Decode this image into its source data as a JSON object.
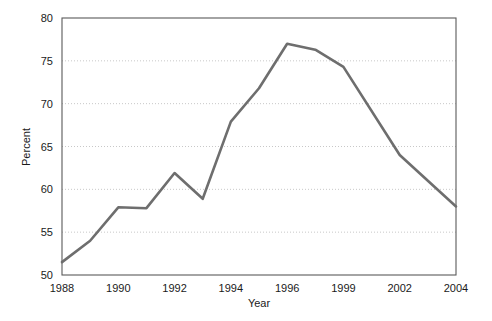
{
  "chart_data": {
    "type": "line",
    "title": "",
    "xlabel": "Year",
    "ylabel": "Percent",
    "grid": true,
    "legend": "none",
    "xtick_labels": [
      "1988",
      "1990",
      "1992",
      "1994",
      "1996",
      "1999",
      "2002",
      "2004"
    ],
    "ytick_labels": [
      "50",
      "55",
      "60",
      "65",
      "70",
      "75",
      "80"
    ],
    "ylim": [
      50,
      80
    ],
    "yticks": [
      50,
      55,
      60,
      65,
      70,
      75,
      80
    ],
    "x": [
      "1988",
      "1989",
      "1990",
      "1991",
      "1992",
      "1993",
      "1994",
      "1995",
      "1996",
      "1997",
      "1999",
      "2002",
      "2004"
    ],
    "values": [
      51.5,
      54,
      57.9,
      57.8,
      61.9,
      58.9,
      67.9,
      71.8,
      77,
      76.3,
      74.3,
      64,
      58
    ],
    "series": [
      {
        "name": "Percent",
        "color": "#6e6e6e",
        "values": [
          51.5,
          54,
          57.9,
          57.8,
          61.9,
          58.9,
          67.9,
          71.8,
          77,
          76.3,
          74.3,
          64,
          58
        ]
      }
    ],
    "colors": {
      "line": "#6e6e6e",
      "axis": "#5a5a5a",
      "grid": "#c8c8c8",
      "text": "#1a1a1a",
      "background": "#ffffff"
    }
  }
}
